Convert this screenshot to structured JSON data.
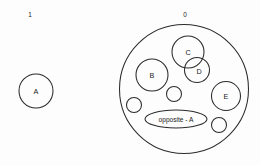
{
  "diagram": {
    "type": "venn-set-diagram",
    "background_color": "#fdfdfd",
    "stroke_color": "#2b2b2b",
    "groups": [
      {
        "id": "group-left",
        "label": "1",
        "label_x": 30,
        "label_y": 14,
        "shape": "none"
      },
      {
        "id": "group-right",
        "label": "0",
        "label_x": 185,
        "label_y": 14,
        "shape": "circle",
        "cx": 184,
        "cy": 89,
        "r": 64.5
      }
    ],
    "nodes": [
      {
        "id": "node-a",
        "label": "A",
        "shape": "circle",
        "cx": 36,
        "cy": 91,
        "r": 17,
        "group": "group-left"
      },
      {
        "id": "node-c",
        "label": "C",
        "shape": "circle",
        "cx": 188,
        "cy": 52,
        "r": 16,
        "group": "group-right"
      },
      {
        "id": "node-d",
        "label": "D",
        "shape": "circle",
        "cx": 197,
        "cy": 70,
        "r": 12.5,
        "group": "group-right"
      },
      {
        "id": "node-b",
        "label": "B",
        "shape": "circle",
        "cx": 152,
        "cy": 75,
        "r": 16,
        "group": "group-right"
      },
      {
        "id": "node-e",
        "label": "E",
        "shape": "circle",
        "cx": 226,
        "cy": 96,
        "r": 14.5,
        "group": "group-right"
      },
      {
        "id": "node-small-1",
        "label": "",
        "shape": "circle",
        "cx": 174,
        "cy": 94,
        "r": 7.5,
        "group": "group-right"
      },
      {
        "id": "node-small-2",
        "label": "",
        "shape": "circle",
        "cx": 134,
        "cy": 105,
        "r": 7.5,
        "group": "group-right"
      },
      {
        "id": "node-small-3",
        "label": "",
        "shape": "circle",
        "cx": 219,
        "cy": 125,
        "r": 7.5,
        "group": "group-right"
      }
    ],
    "ellipse_node": {
      "id": "node-opposite-a",
      "label": "opposite - A",
      "shape": "ellipse",
      "cx": 176,
      "cy": 119,
      "rx": 31,
      "ry": 9,
      "group": "group-right"
    }
  }
}
